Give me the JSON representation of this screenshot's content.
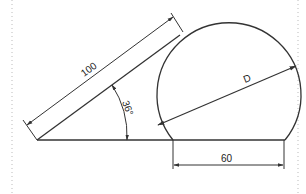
{
  "drawing": {
    "title": "Geometry dimension drawing",
    "colors": {
      "line": "#333333",
      "border": "#bbbbbb",
      "background": "#ffffff"
    },
    "labels": {
      "length": "100",
      "angle": "36°",
      "diameter": "D",
      "chord": "60"
    }
  }
}
